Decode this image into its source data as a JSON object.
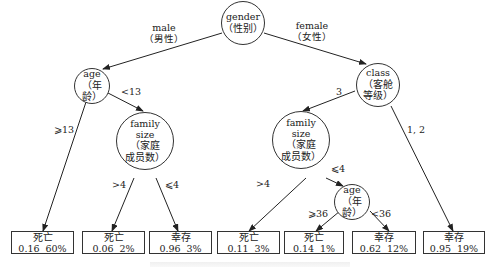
{
  "tree": {
    "root": {
      "en": "gender",
      "zh": "（性别）"
    },
    "branches": {
      "male": {
        "en": "male",
        "zh": "（男性）"
      },
      "female": {
        "en": "female",
        "zh": "（女性）"
      },
      "age_ge13": "⩾13",
      "age_lt13": "<13",
      "fam_left_gt4": ">4",
      "fam_left_le4": "⩽4",
      "class_3": "3",
      "class_12": "1, 2",
      "fam_right_gt4": ">4",
      "fam_right_le4": "⩽4",
      "age_ge36": "⩾36",
      "age_lt36": "<36"
    },
    "nodes": {
      "age_left": {
        "en": "age",
        "zh": "（年龄）"
      },
      "family_left": {
        "en1": "family",
        "en2": "size",
        "zh1": "（家庭",
        "zh2": "成员数）"
      },
      "class": {
        "en": "class",
        "zh1": "（客舱",
        "zh2": "等级）"
      },
      "family_right": {
        "en1": "family",
        "en2": "size",
        "zh1": "（家庭",
        "zh2": "成员数）"
      },
      "age_right": {
        "en": "age",
        "zh": "（年龄）"
      }
    },
    "leaves": [
      {
        "label": "死亡",
        "prob": "0.16",
        "pct": "60%"
      },
      {
        "label": "死亡",
        "prob": "0.06",
        "pct": "2%"
      },
      {
        "label": "幸存",
        "prob": "0.96",
        "pct": "3%"
      },
      {
        "label": "死亡",
        "prob": "0.11",
        "pct": "3%"
      },
      {
        "label": "死亡",
        "prob": "0.14",
        "pct": "1%"
      },
      {
        "label": "幸存",
        "prob": "0.62",
        "pct": "12%"
      },
      {
        "label": "幸存",
        "prob": "0.95",
        "pct": "19%"
      }
    ]
  }
}
